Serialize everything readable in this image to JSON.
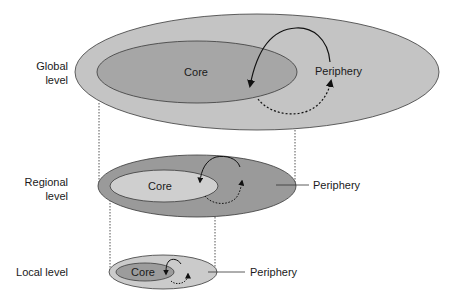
{
  "levels": {
    "global": {
      "label_line1": "Global",
      "label_line2": "level",
      "core_label": "Core",
      "periphery_label": "Periphery",
      "outer_color": "#c4c4c4",
      "core_color": "#a6a6a6"
    },
    "regional": {
      "label_line1": "Regional",
      "label_line2": "level",
      "core_label": "Core",
      "periphery_label": "Periphery",
      "outer_color": "#9a9a9a",
      "core_color": "#cfcfcf"
    },
    "local": {
      "label_line1": "Local level",
      "core_label": "Core",
      "periphery_label": "Periphery",
      "outer_color": "#cbcbcb",
      "core_color": "#9c9c9c"
    }
  },
  "colors": {
    "stroke": "#3a3a3a",
    "arrow": "#111111",
    "text": "#1a1a1a",
    "background": "#ffffff"
  }
}
